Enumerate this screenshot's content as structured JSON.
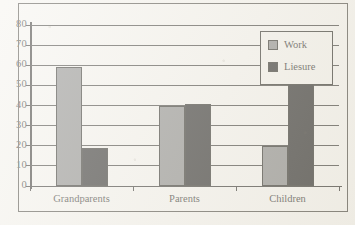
{
  "chart_data": {
    "type": "bar",
    "title": "",
    "subtitle": "",
    "xlabel": "",
    "ylabel": "",
    "categories": [
      "Grandparents",
      "Parents",
      "Children"
    ],
    "series": [
      {
        "name": "Work",
        "color": "#7d7d7b",
        "values": [
          59,
          40,
          20
        ]
      },
      {
        "name": "Liesure",
        "color": "#100f0d",
        "values": [
          19,
          41,
          77
        ]
      }
    ],
    "ylim": [
      0,
      80
    ],
    "ytick_values": [
      0,
      10,
      20,
      30,
      40,
      50,
      60,
      70,
      80
    ],
    "ytick_labels": [
      "0",
      "10",
      "20",
      "30",
      "40",
      "50",
      "60",
      "70",
      "80"
    ],
    "grid": true,
    "grid_axis": "y",
    "legend_position": "top-right",
    "legend_entries": [
      "Work",
      "Liesure"
    ]
  },
  "axis": {
    "y_ticks": [
      {
        "label": "80",
        "value": 80
      },
      {
        "label": "70",
        "value": 70
      },
      {
        "label": "60",
        "value": 60
      },
      {
        "label": "50",
        "value": 50
      },
      {
        "label": "40",
        "value": 40
      },
      {
        "label": "30",
        "value": 30
      },
      {
        "label": "20",
        "value": 20
      },
      {
        "label": "10",
        "value": 10
      },
      {
        "label": "0",
        "value": 0
      }
    ]
  },
  "legend": {
    "items": [
      {
        "label": "Work",
        "color": "#7d7d7b"
      },
      {
        "label": "Liesure",
        "color": "#100f0d"
      }
    ]
  },
  "colors": {
    "work": "#7d7d7b",
    "leisure": "#100f0d",
    "ink": "#1b1a16",
    "paper": "#f4f2ec"
  }
}
